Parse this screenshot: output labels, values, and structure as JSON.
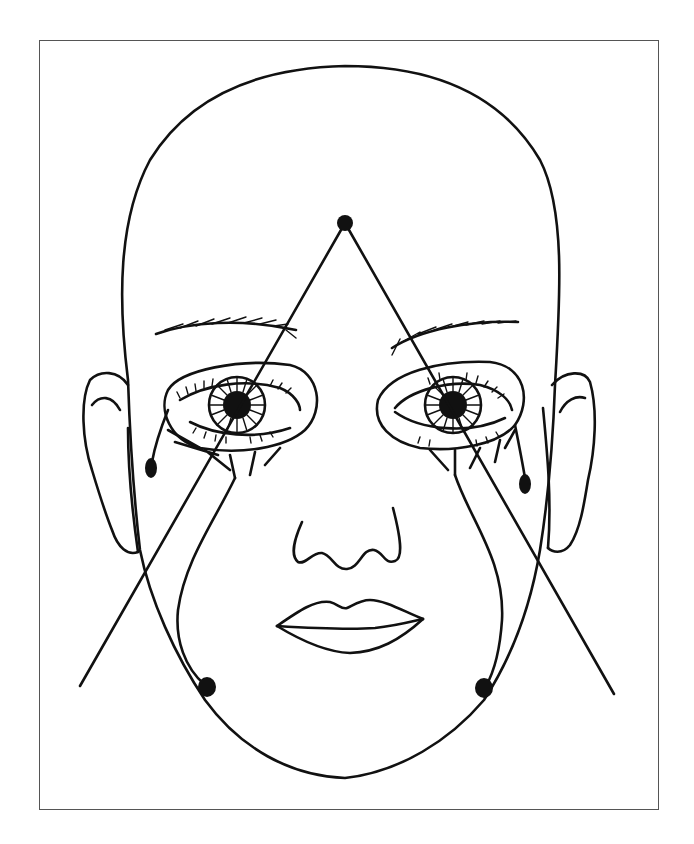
{
  "figure": {
    "type": "line-illustration",
    "colors": {
      "stroke": "#111111",
      "background": "#ffffff",
      "frame": "#555555"
    },
    "markers": [
      {
        "name": "apex-point",
        "x": 345,
        "y": 223
      },
      {
        "name": "left-eye-corner-drop",
        "x": 151,
        "y": 468
      },
      {
        "name": "right-eye-corner-drop",
        "x": 525,
        "y": 484
      },
      {
        "name": "left-jaw-drop",
        "x": 207,
        "y": 687
      },
      {
        "name": "right-jaw-drop",
        "x": 484,
        "y": 688
      }
    ],
    "triangle": {
      "apex": [
        345,
        223
      ],
      "left_end": [
        80,
        686
      ],
      "right_end": [
        614,
        694
      ]
    }
  }
}
